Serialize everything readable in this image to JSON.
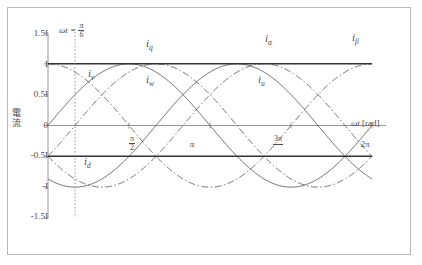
{
  "chart_data": {
    "type": "line",
    "title": "",
    "xlabel": "ωt [rad]",
    "ylabel": "電流",
    "xlim": [
      0,
      6.283185307179586
    ],
    "ylim": [
      -1.5,
      1.5
    ],
    "grid": false,
    "legend": "inline-labels",
    "xticks": [
      {
        "value": 1.5707963,
        "label": "π/2",
        "num": "π",
        "den": "2"
      },
      {
        "value": 3.1415927,
        "label": "π",
        "num": "",
        "den": ""
      },
      {
        "value": 4.712389,
        "label": "3π/2",
        "num": "3π",
        "den": "2"
      },
      {
        "value": 6.2831853,
        "label": "2π",
        "num": "",
        "den": ""
      }
    ],
    "yticks": [
      {
        "value": 1.5,
        "label": "1.5I"
      },
      {
        "value": 1.0,
        "label": "I"
      },
      {
        "value": 0.5,
        "label": "0.5I"
      },
      {
        "value": 0.0,
        "label": "0"
      },
      {
        "value": -0.5,
        "label": "-0.5I"
      },
      {
        "value": -1.0,
        "label": "-I"
      },
      {
        "value": -1.5,
        "label": "-1.5I"
      }
    ],
    "annotations": [
      {
        "name": "omega-t-marker",
        "text": "ωt = π/6",
        "x": 0.5235988,
        "style": "vertical-dotted"
      }
    ],
    "series": [
      {
        "name": "i_u",
        "label": "iu",
        "sub": "u",
        "style": "dashed",
        "color": "#555555",
        "formula": "I*cos(wt)",
        "amplitude": 1.0,
        "phase_deg": 0,
        "label_x": 4.25,
        "label_y": 0.8
      },
      {
        "name": "i_v",
        "label": "iv",
        "sub": "v",
        "style": "dashed",
        "color": "#555555",
        "formula": "I*cos(wt - 2pi/3)",
        "amplitude": 1.0,
        "phase_deg": -120,
        "label_x": 0.95,
        "label_y": 0.86
      },
      {
        "name": "i_w",
        "label": "iw",
        "sub": "w",
        "style": "dashed",
        "color": "#555555",
        "formula": "I*cos(wt + 2pi/3)",
        "amplitude": 1.0,
        "phase_deg": 120,
        "label_x": 2.35,
        "label_y": 0.8
      },
      {
        "name": "i_alpha",
        "label": "iα",
        "sub": "α",
        "style": "solid",
        "color": "#4f4f4f",
        "formula": "I*sin(wt)",
        "amplitude": 1.0,
        "phase_deg": -90,
        "label_x": 3.95,
        "label_y": 1.3
      },
      {
        "name": "i_beta",
        "label": "iβ",
        "sub": "β",
        "style": "solid",
        "color": "#4f4f4f",
        "formula": "-I*sin(wt + pi/3)",
        "amplitude": 1.0,
        "phase_deg": 60,
        "label_x": 5.4,
        "label_y": 1.32
      },
      {
        "name": "i_q",
        "label": "iq",
        "sub": "q",
        "style": "solid-flat",
        "color": "#333333",
        "formula": "I (constant)",
        "value": 1.0,
        "label_x": 2.1,
        "label_y": 1.22
      },
      {
        "name": "i_d",
        "label": "id",
        "sub": "d",
        "style": "solid-flat",
        "color": "#333333",
        "formula": "-0.5I (constant)",
        "value": -0.5,
        "label_x": 1.45,
        "label_y": -0.33
      }
    ]
  },
  "axis": {
    "x_name_italic": "ωt",
    "x_name_unit": " [rad]",
    "y_name": "電流"
  },
  "marker": {
    "prefix": "ωt =",
    "num": "π",
    "den": "6"
  },
  "colors": {
    "frame": "#b8b8b8",
    "axis": "#8c8c8c",
    "curve_solid": "#4f4f4f",
    "curve_dashed": "#555555",
    "flat_line": "#333333",
    "marker_line": "#9a9a9a",
    "text": "#4a4a4a"
  }
}
